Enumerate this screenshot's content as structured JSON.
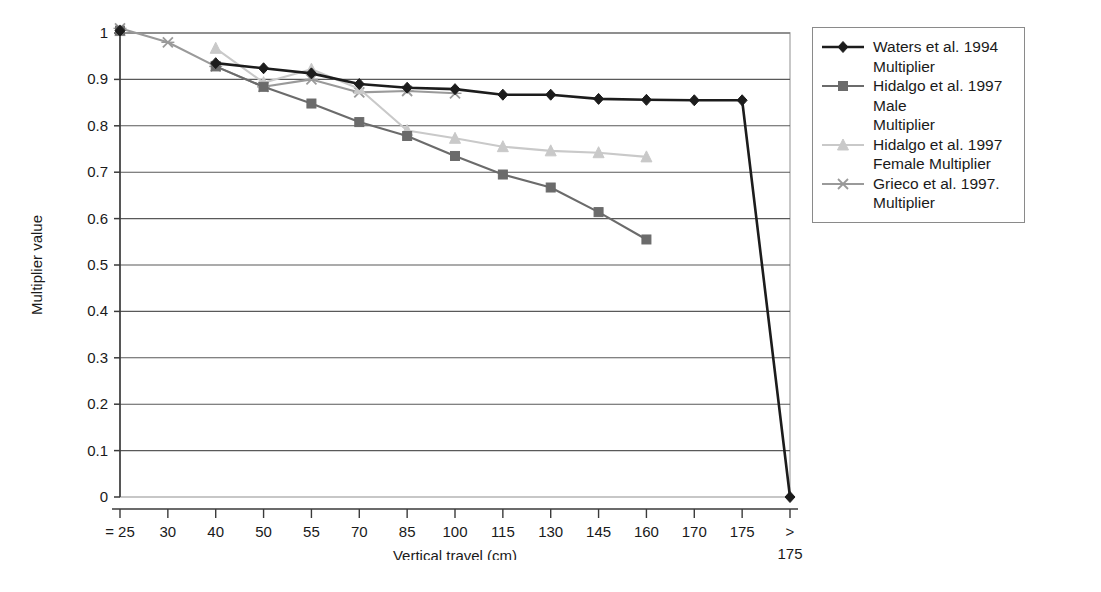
{
  "chart_data": {
    "type": "line",
    "title": "",
    "xlabel": "Vertical travel (cm)",
    "ylabel": "Multiplier value",
    "categories": [
      "= 25",
      "30",
      "40",
      "50",
      "55",
      "70",
      "85",
      "100",
      "115",
      "130",
      "145",
      "160",
      "170",
      "175",
      "> 175"
    ],
    "ylim": [
      0,
      1
    ],
    "yticks": [
      "0",
      "0.1",
      "0.2",
      "0.3",
      "0.4",
      "0.5",
      "0.6",
      "0.7",
      "0.8",
      "0.9",
      "1"
    ],
    "grid": true,
    "legend_position": "right",
    "series": [
      {
        "name": "Waters et al. 1994 Multiplier",
        "marker": "diamond",
        "color": "#1c1c1c",
        "values": [
          1.005,
          null,
          0.935,
          0.924,
          0.913,
          0.89,
          0.882,
          0.879,
          0.867,
          0.867,
          0.858,
          0.856,
          0.855,
          0.855,
          0.0
        ]
      },
      {
        "name": "Hidalgo et al. 1997 Male Multiplier",
        "marker": "square",
        "color": "#6b6b6b",
        "values": [
          1.005,
          null,
          0.928,
          0.884,
          0.848,
          0.808,
          0.778,
          0.735,
          0.695,
          0.667,
          0.614,
          0.555,
          null,
          null,
          null
        ]
      },
      {
        "name": "Hidalgo et al. 1997 Female Multiplier",
        "marker": "triangle",
        "color": "#c9c9c9",
        "values": [
          1.005,
          null,
          0.967,
          0.893,
          0.922,
          0.88,
          0.79,
          0.773,
          0.755,
          0.746,
          0.742,
          0.733,
          null,
          null,
          null
        ]
      },
      {
        "name": "Grieco et al. 1997. Multiplier",
        "marker": "x",
        "color": "#9a9a9a",
        "values": [
          1.01,
          0.98,
          0.928,
          0.884,
          0.9,
          0.872,
          0.875,
          0.87,
          null,
          null,
          null,
          null,
          null,
          null,
          null
        ]
      }
    ]
  },
  "legend": {
    "entries": [
      {
        "label": "Waters et al. 1994\nMultiplier",
        "marker": "diamond",
        "color": "#1c1c1c"
      },
      {
        "label": "Hidalgo et al. 1997 Male\nMultiplier",
        "marker": "square",
        "color": "#6b6b6b"
      },
      {
        "label": "Hidalgo et al. 1997\nFemale Multiplier",
        "marker": "triangle",
        "color": "#c9c9c9"
      },
      {
        "label": "Grieco et al. 1997.\nMultiplier",
        "marker": "x",
        "color": "#9a9a9a"
      }
    ]
  }
}
